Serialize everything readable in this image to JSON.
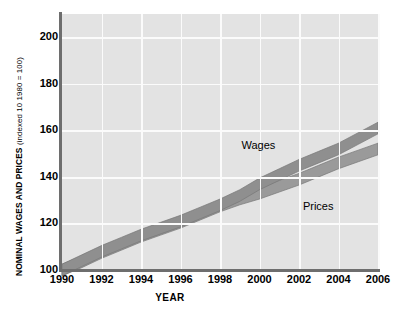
{
  "chart_data": {
    "type": "area",
    "title": "",
    "xlabel": "YEAR",
    "ylabel": "NOMINAL WAGES AND PRICES",
    "ylabel_paren": "(indexed 10 1980 = 100)",
    "xlim": [
      1990,
      2006
    ],
    "ylim": [
      100,
      210
    ],
    "grid": true,
    "legend_position": "inline-annotations",
    "xticks": [
      "1990",
      "1992",
      "1994",
      "1996",
      "1998",
      "2000",
      "2002",
      "2004",
      "2006"
    ],
    "xtick_values": [
      1990,
      1992,
      1994,
      1996,
      1998,
      2000,
      2002,
      2004,
      2006
    ],
    "yticks": [
      "100",
      "120",
      "140",
      "160",
      "180",
      "200"
    ],
    "ytick_values": [
      100,
      120,
      140,
      160,
      180,
      200
    ],
    "x": [
      1990,
      1991,
      1992,
      1993,
      1994,
      1995,
      1996,
      1997,
      1998,
      1999,
      2000,
      2001,
      2002,
      2003,
      2004,
      2005,
      2006
    ],
    "series": [
      {
        "name": "Wages",
        "color": "#8f8f8f",
        "band_width": 2.5,
        "values": [
          100,
          104,
          108,
          111.5,
          115,
          118,
          121,
          124.5,
          128,
          132,
          137,
          141,
          145,
          148.5,
          152,
          156.5,
          161
        ]
      },
      {
        "name": "Prices",
        "color": "#9a9a9a",
        "band_width": 2.5,
        "values": [
          100,
          103.5,
          107.5,
          111,
          114.5,
          117.5,
          120.5,
          124,
          127.5,
          130.5,
          133,
          136,
          139,
          142.5,
          146,
          149,
          152
        ]
      }
    ],
    "annotations": [
      {
        "label": "Wages",
        "x": 2000.0,
        "y": 150.0
      },
      {
        "label": "Prices",
        "x": 2002.3,
        "y": 134.0
      }
    ],
    "colors": {
      "plot_background": "#e3e3e3",
      "gridline": "#fbfbfb",
      "axis": "#6e6e6e",
      "band": "#8f8f8f",
      "band_edge": "#777777",
      "text": "#000000"
    }
  }
}
